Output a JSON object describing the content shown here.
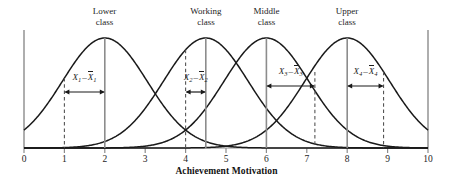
{
  "figure": {
    "axis_title": "Achievement Motivation",
    "x_ticks": [
      "0",
      "1",
      "2",
      "3",
      "4",
      "5",
      "6",
      "7",
      "8",
      "9",
      "10"
    ],
    "x_range": [
      0,
      10
    ],
    "colors": {
      "curve": "#1a1a1a",
      "mean_line": "#8c8c8c",
      "dashed_line": "#555555",
      "axis": "#8c8c8c",
      "text": "#1d1d1d"
    },
    "groups": [
      {
        "label_line1": "Lower",
        "label_line2": "class",
        "mean": 2.0,
        "sd": 1.05,
        "score": 1.0,
        "deviation_label": {
          "x": "X",
          "xsub": "1",
          "op": "–",
          "xbar": "X",
          "xbarsub": "1"
        }
      },
      {
        "label_line1": "Working",
        "label_line2": "class",
        "mean": 4.5,
        "sd": 1.05,
        "score": 4.0,
        "deviation_label": {
          "x": "X",
          "xsub": "2",
          "op": "–",
          "xbar": "X",
          "xbarsub": "2"
        }
      },
      {
        "label_line1": "Middle",
        "label_line2": "class",
        "mean": 6.0,
        "sd": 1.05,
        "score": 7.2,
        "deviation_label": {
          "x": "X",
          "xsub": "3",
          "op": "–",
          "xbar": "X",
          "xbarsub": "3"
        }
      },
      {
        "label_line1": "Upper",
        "label_line2": "class",
        "mean": 8.0,
        "sd": 1.05,
        "score": 8.9,
        "deviation_label": {
          "x": "X",
          "xsub": "4",
          "op": "–",
          "xbar": "X",
          "xbarsub": "4"
        }
      }
    ]
  },
  "chart_data": {
    "type": "line",
    "title": "",
    "xlabel": "Achievement Motivation",
    "ylabel": "",
    "xlim": [
      0,
      10
    ],
    "grid": false,
    "legend": "none",
    "tick_labels": [
      "0",
      "1",
      "2",
      "3",
      "4",
      "5",
      "6",
      "7",
      "8",
      "9",
      "10"
    ],
    "series": [
      {
        "name": "Lower class",
        "distribution": "normal",
        "mean": 2.0,
        "sd": 1.05,
        "individual_score": 1.0,
        "deviation": -1.0,
        "annotation": "X1 - X̄1"
      },
      {
        "name": "Working class",
        "distribution": "normal",
        "mean": 4.5,
        "sd": 1.05,
        "individual_score": 4.0,
        "deviation": -0.5,
        "annotation": "X2 - X̄2"
      },
      {
        "name": "Middle class",
        "distribution": "normal",
        "mean": 6.0,
        "sd": 1.05,
        "individual_score": 7.2,
        "deviation": 1.2,
        "annotation": "X3 - X̄3"
      },
      {
        "name": "Upper class",
        "distribution": "normal",
        "mean": 8.0,
        "sd": 1.05,
        "individual_score": 8.9,
        "deviation": 0.9,
        "annotation": "X4 - X̄4"
      }
    ]
  }
}
